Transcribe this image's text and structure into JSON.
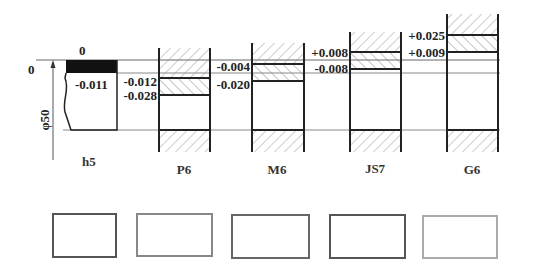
{
  "diagram": {
    "basic_size_label": "φ50",
    "zero_line_label": "0",
    "shaft": {
      "name": "h5",
      "upper_deviation": "0",
      "lower_deviation": "-0.011"
    },
    "holes": [
      {
        "name": "P6",
        "upper_deviation": "-0.012",
        "lower_deviation": "-0.028"
      },
      {
        "name": "M6",
        "upper_deviation": "-0.004",
        "lower_deviation": "-0.020"
      },
      {
        "name": "JS7",
        "upper_deviation": "+0.008",
        "lower_deviation": "-0.008"
      },
      {
        "name": "G6",
        "upper_deviation": "+0.025",
        "lower_deviation": "+0.009"
      }
    ]
  },
  "answer_boxes": [
    {
      "label": "",
      "border_color": "#555555"
    },
    {
      "label": "",
      "border_color": "#888888"
    },
    {
      "label": "",
      "border_color": "#666666"
    },
    {
      "label": "",
      "border_color": "#555555"
    },
    {
      "label": "",
      "border_color": "#aaaaaa"
    }
  ]
}
